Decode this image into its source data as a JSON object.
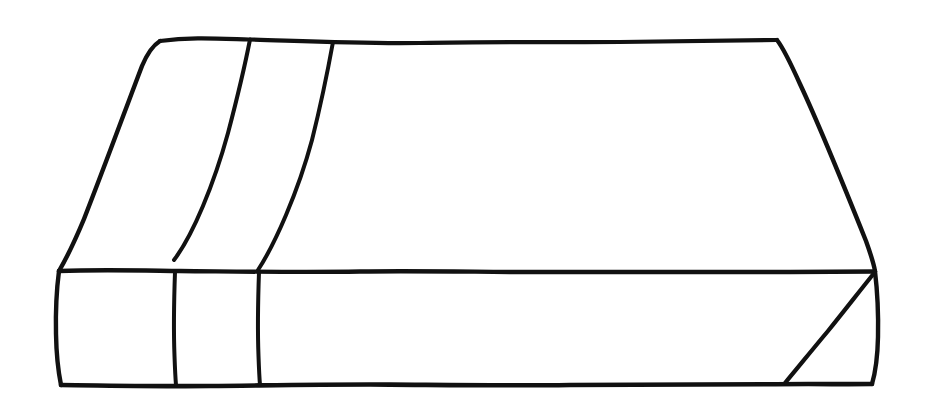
{
  "canvas": {
    "width": 928,
    "height": 412,
    "background_color": "#ffffff",
    "ink_color": "#111111",
    "title": "Hand-drawn line sketch of a rectangular slab / book-like box"
  },
  "drawing": {
    "subject": "box",
    "style": "hand-drawn-pen-line-art",
    "stroke_width": 4,
    "description": "Three-quarter view of a flat rectangular slab, drawn as a top parallelogram face and a front rectangular face, with two slanted dividing lines across the top and two matching vertical dividers on the front edge, plus a diagonal fold at the bottom-right corner.",
    "parts": [
      {
        "name": "top-face",
        "kind": "parallelogram",
        "points": [
          [
            160,
            40
          ],
          [
            777,
            40
          ],
          [
            875,
            271
          ],
          [
            59,
            271
          ]
        ]
      },
      {
        "name": "front-face",
        "kind": "rectangle",
        "points": [
          [
            59,
            271
          ],
          [
            875,
            271
          ],
          [
            875,
            385
          ],
          [
            61,
            385
          ]
        ]
      },
      {
        "name": "top-divider-1",
        "kind": "slant-line",
        "points": [
          [
            250,
            40
          ],
          [
            174,
            260
          ]
        ]
      },
      {
        "name": "top-divider-2",
        "kind": "slant-line",
        "points": [
          [
            333,
            42
          ],
          [
            258,
            270
          ]
        ]
      },
      {
        "name": "front-divider-1",
        "kind": "vertical-line",
        "points": [
          [
            175,
            272
          ],
          [
            176,
            385
          ]
        ]
      },
      {
        "name": "front-divider-2",
        "kind": "vertical-line",
        "points": [
          [
            259,
            272
          ],
          [
            260,
            385
          ]
        ]
      },
      {
        "name": "corner-diagonal",
        "kind": "diagonal-line",
        "points": [
          [
            875,
            272
          ],
          [
            785,
            383
          ]
        ]
      }
    ]
  },
  "paths": {
    "top_edge": "M 160 41 C 190 37, 215 38.5, 249 39.5 C 300 41, 360 44, 420 43 C 500 41.5, 560 42.5, 620 42 C 680 41.5, 730 40.5, 777 40",
    "left_slant_outer": "M 160 41 C 152 46, 147 54, 142 66 C 126 108, 104 168, 84 219 C 74 243, 66 259, 59 271",
    "right_slant_outer": "M 777 40 C 784 49, 791 64, 800 84 C 822 131, 848 196, 866 241 C 871 255, 874 265, 875 271",
    "front_top_edge": "M 59 271 C 100 269.5, 140 270.5, 180 271 C 240 271.5, 300 272.5, 360 271.5 C 430 270.5, 500 272.5, 560 272 C 640 271.5, 720 272.5, 790 272 C 830 271.7, 858 271.4, 875 271.5",
    "front_bottom_edge": "M 61 385 C 110 385.5, 160 386.5, 210 386 C 270 385.4, 330 384.2, 390 384.6 C 450 385, 510 385.8, 570 385 C 640 384.1, 710 384.8, 775 384.2 C 815 383.8, 850 384.4, 872 384",
    "front_left_edge": "M 59 271 C 56.5 290, 55.5 312, 56 334 C 56.3 352, 58 370, 61 385",
    "front_right_edge": "M 875 271.5 C 877.5 292, 878.5 314, 878 337 C 877.6 356, 875.5 372, 872 384",
    "top_divider_1": "M 250 39.5 C 246 60, 238 95, 228 133 C 214 184, 193 235, 174 260",
    "top_divider_2": "M 333 42 C 329 64, 322 100, 312 140 C 298 192, 275 244, 258 270",
    "front_divider_1": "M 175 272 C 174 300, 173.5 330, 174.5 356 C 175 370, 175.5 379, 176 385",
    "front_divider_2": "M 259 272 C 258 300, 257.5 330, 258.5 356 C 259 370, 259.5 379, 260 385",
    "corner_diagonal": "M 875 272 C 862 288, 845 310, 828 331 C 812 350, 796 370, 785 383"
  }
}
